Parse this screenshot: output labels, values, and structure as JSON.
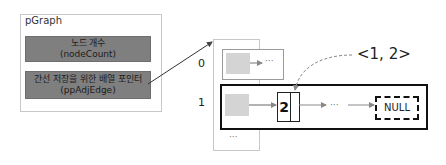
{
  "pgraph": {
    "title": "pGraph",
    "fields": [
      {
        "label_ko": "노드 개수",
        "label_en": "(nodeCount)"
      },
      {
        "label_ko": "간선 저장을 위한 배열 포인터",
        "label_en": "(ppAdjEdge)"
      }
    ]
  },
  "adj_array": {
    "indices": [
      "0",
      "1"
    ],
    "ellipsis": "···",
    "entry0_ellipsis": "···"
  },
  "list_row1": {
    "node_value": "2",
    "ellipsis": "···",
    "null_label": "NULL"
  },
  "edge_label": "<1, 2>",
  "colors": {
    "field_fill": "#7f7f7f",
    "placeholder_gray": "#d4d4d4",
    "arrow": "#555555",
    "highlight_border": "#111111"
  }
}
